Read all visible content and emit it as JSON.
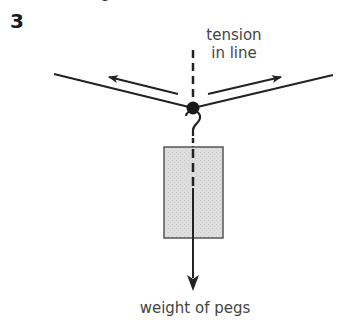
{
  "figure": {
    "number": "3",
    "type": "force diagram"
  },
  "labels": {
    "tension_line1": "tension",
    "tension_line2": "in line",
    "weight": "weight of pegs"
  },
  "elements": {
    "line": "washing line (two segments meeting at knot)",
    "knot": "hook attachment point",
    "object": "bag of pegs (shaded rectangle)",
    "forces": [
      {
        "name": "tension-left",
        "direction": "up-left along line"
      },
      {
        "name": "tension-right",
        "direction": "up-right along line"
      },
      {
        "name": "weight",
        "direction": "down"
      }
    ],
    "reference": "dashed vertical line"
  },
  "colors": {
    "ink": "#222222",
    "text": "#444444",
    "fill": "#dcdcdc"
  }
}
